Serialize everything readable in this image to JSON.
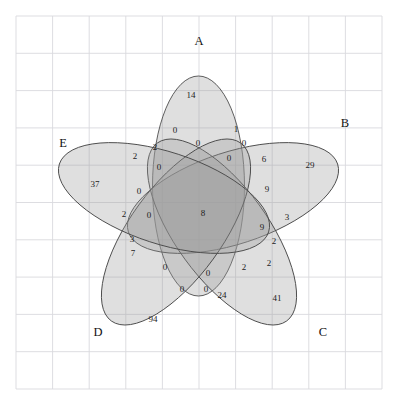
{
  "figure": {
    "type": "venn-diagram",
    "set_count": 5,
    "background_color": "#ffffff",
    "grid_color": "#d9d9de",
    "ellipse_stroke_color": "#4d4d4d",
    "ellipse_fill_color": "#9a9a9a"
  },
  "grid": {
    "x_start": 16,
    "y_start": 16,
    "x_end": 382,
    "y_end": 389,
    "columns": 10,
    "rows": 10,
    "cell_width": 36.6,
    "cell_height": 37.3
  },
  "chart_data": {
    "type": "venn",
    "title": "",
    "sets": [
      "A",
      "B",
      "C",
      "D",
      "E"
    ],
    "set_labels": [
      {
        "name": "A",
        "x": 199,
        "y": 42
      },
      {
        "name": "B",
        "x": 345,
        "y": 124
      },
      {
        "name": "C",
        "x": 323,
        "y": 333
      },
      {
        "name": "D",
        "x": 98,
        "y": 333
      },
      {
        "name": "E",
        "x": 63,
        "y": 144
      }
    ],
    "ellipses": [
      {
        "set": "A",
        "cx": 198.5,
        "cy": 186,
        "rx": 46,
        "ry": 110,
        "rotation": 0
      },
      {
        "set": "B",
        "cx": 233,
        "cy": 198,
        "rx": 46,
        "ry": 110,
        "rotation": 72
      },
      {
        "set": "C",
        "cx": 222,
        "cy": 232,
        "rx": 46,
        "ry": 110,
        "rotation": 144
      },
      {
        "set": "D",
        "cx": 176,
        "cy": 232,
        "rx": 46,
        "ry": 110,
        "rotation": 216
      },
      {
        "set": "E",
        "cx": 164,
        "cy": 198,
        "rx": 46,
        "ry": 110,
        "rotation": 288
      }
    ],
    "regions": [
      {
        "label": "A",
        "value": 14,
        "x": 191,
        "y": 96
      },
      {
        "label": "B",
        "value": 29,
        "x": 310,
        "y": 166
      },
      {
        "label": "C",
        "value": 41,
        "x": 277,
        "y": 299
      },
      {
        "label": "D",
        "value": 94,
        "x": 153,
        "y": 320
      },
      {
        "label": "E",
        "value": 37,
        "x": 95,
        "y": 185
      },
      {
        "label": "AE",
        "value": 2,
        "x": 135,
        "y": 157
      },
      {
        "label": "AB",
        "value": 1,
        "x": 236,
        "y": 130
      },
      {
        "label": "BC",
        "value": 3,
        "x": 287,
        "y": 218
      },
      {
        "label": "CD",
        "value": 24,
        "x": 222,
        "y": 296
      },
      {
        "label": "DE",
        "value": 7,
        "x": 133,
        "y": 254
      },
      {
        "label": "AD",
        "value": 0,
        "x": 175,
        "y": 131
      },
      {
        "label": "AC",
        "value": 0,
        "x": 198,
        "y": 144
      },
      {
        "label": "BD",
        "value": 0,
        "x": 229,
        "y": 159
      },
      {
        "label": "BE",
        "value": 6,
        "x": 264,
        "y": 160
      },
      {
        "label": "CE",
        "value": 0,
        "x": 244,
        "y": 144
      },
      {
        "label": "ABE",
        "value": 2,
        "x": 155,
        "y": 148
      },
      {
        "label": "ABD",
        "value": 0,
        "x": 159,
        "y": 168
      },
      {
        "label": "ADE",
        "value": 0,
        "x": 139,
        "y": 192
      },
      {
        "label": "ACE",
        "value": 2,
        "x": 124,
        "y": 215
      },
      {
        "label": "ACD",
        "value": 3,
        "x": 132,
        "y": 240
      },
      {
        "label": "BCE",
        "value": 9,
        "x": 267,
        "y": 190
      },
      {
        "label": "BCD",
        "value": 9,
        "x": 262,
        "y": 228
      },
      {
        "label": "BDE",
        "value": 2,
        "x": 274,
        "y": 242
      },
      {
        "label": "CDE",
        "value": 2,
        "x": 269,
        "y": 264
      },
      {
        "label": "ABC",
        "value": 0,
        "x": 149,
        "y": 216
      },
      {
        "label": "ABCD",
        "value": 0,
        "x": 165,
        "y": 268
      },
      {
        "label": "ABCE",
        "value": 0,
        "x": 182,
        "y": 290
      },
      {
        "label": "ABDE",
        "value": 0,
        "x": 206,
        "y": 290
      },
      {
        "label": "ACDE",
        "value": 0,
        "x": 208,
        "y": 274
      },
      {
        "label": "BCDE",
        "value": 2,
        "x": 244,
        "y": 268
      },
      {
        "label": "ABCDE",
        "value": 8,
        "x": 203,
        "y": 214
      }
    ]
  }
}
